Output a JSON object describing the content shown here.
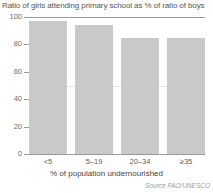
{
  "chart_data": {
    "type": "bar",
    "title": "Ratio of girls attending primary school as % of ratio of boys",
    "xlabel": "% of population undernourished",
    "ylabel": "",
    "categories": [
      "<5",
      "5–19",
      "20–34",
      "≥35"
    ],
    "values": [
      97,
      94,
      85,
      85
    ],
    "ylim": [
      0,
      100
    ],
    "yticks": [
      0,
      20,
      40,
      60,
      80,
      100
    ],
    "ytick_labels": [
      "0",
      "20",
      "40",
      "60",
      "80",
      "100"
    ],
    "grid": "horizontal-light",
    "legend": "none",
    "bar_color": "#c9c9c9",
    "axis_color": "#9a9a9a",
    "source": "Source FAO/UNESCO"
  }
}
